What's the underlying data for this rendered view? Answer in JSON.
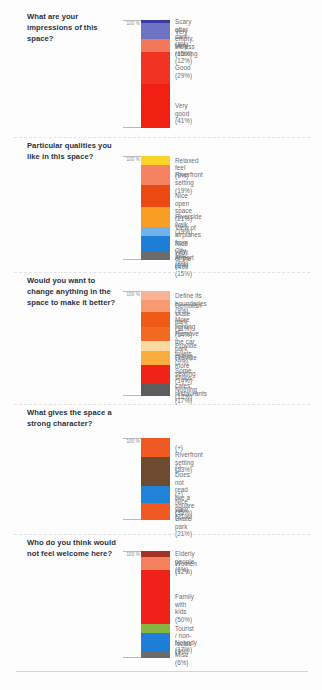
{
  "page": {
    "top_cut_text": "",
    "axis_label": "100 %"
  },
  "chart_data": [
    {
      "type": "bar",
      "stacked": true,
      "title": "What are your impressions of this space?",
      "xlabel": "",
      "ylabel": "100 %",
      "ylim": [
        0,
        100
      ],
      "grid": false,
      "legend_position": "right",
      "categories": [
        "Scary after dark",
        "Very empty, lifeless",
        "Very relaxing",
        "Good",
        "Very good"
      ],
      "values": [
        3,
        15,
        12,
        29,
        41
      ],
      "labels": [
        "Scary after dark (3%)",
        "Very empty, lifeless (15%)",
        "Very relaxing  (12%)",
        "Good (29%)",
        "Very good (41%)"
      ],
      "colors": [
        "#3a3aa8",
        "#6f73c4",
        "#f4775c",
        "#f03323",
        "#f02012"
      ]
    },
    {
      "type": "bar",
      "stacked": true,
      "title": "Particular qualities you like in this space?",
      "xlabel": "",
      "ylabel": "100 %",
      "ylim": [
        0,
        100
      ],
      "grid": false,
      "legend_position": "right",
      "categories": [
        "Relaxed feel",
        "Riverfront setting",
        "Nice open space",
        "Riverside walk",
        "View of airplanes from City Airport",
        "Nice view of the river",
        "Misc"
      ],
      "values": [
        9,
        19,
        21,
        19,
        9,
        15,
        8
      ],
      "labels": [
        "Relaxed feel (9%)",
        "Riverfront setting (19%)",
        "Nice open space (21%)",
        "Riverside walk (19%)",
        "View of airplanes from\nCity Airport (9%)",
        "Nice view of the river (15%)",
        "Misc (8%)"
      ],
      "colors": [
        "#fdd429",
        "#f58260",
        "#eb4b12",
        "#f99d23",
        "#71b2ec",
        "#1f7fd6",
        "#6b6b6b"
      ]
    },
    {
      "type": "bar",
      "stacked": true,
      "title": "Would you want to change anything in the space to make it better?",
      "xlabel": "",
      "ylabel": "100 %",
      "ylim": [
        0,
        100
      ],
      "grid": false,
      "legend_position": "right",
      "categories": [
        "Define its boundaries",
        "Demolish skate park",
        "More lighting",
        "Remove the car park",
        "Provide toilets",
        "Provide more seating",
        "Some shops, cafes, restaurants",
        "Nothing"
      ],
      "values": [
        9,
        11,
        14,
        14,
        9,
        14,
        17,
        12
      ],
      "labels": [
        "Define its boundaries (9%)",
        "Demolish skate park (11%)",
        "More lighting (14%)",
        "Remove the car park (14%)",
        "Provide toilets (9%)",
        "Provide more seating (14%)",
        "Some shops, cafes,\nrestaurants (17%)",
        "Nothing (12%)"
      ],
      "colors": [
        "#f8b394",
        "#f79a72",
        "#ef5a14",
        "#f26a21",
        "#fbd9a3",
        "#f9ad3c",
        "#ef2318",
        "#5d5d5d"
      ]
    },
    {
      "type": "bar",
      "stacked": true,
      "title": "What gives the space a strong character?",
      "xlabel": "",
      "ylabel": "100 %",
      "ylim": [
        0,
        100
      ],
      "grid": false,
      "legend_position": "right",
      "categories": [
        "(+) Riverfront setting",
        "(-) Does not read like a square",
        "(+) Nice view",
        "(+) Skate park"
      ],
      "values": [
        23,
        35,
        21,
        21
      ],
      "labels": [
        "(+) Riverfront setting (23%)",
        "(-) Does not read like a\n      square (35%)",
        "(+) Nice view (21%)",
        "(+) Skate park (21%)"
      ],
      "colors": [
        "#f05a22",
        "#6d4b30",
        "#2083d8",
        "#f05a22"
      ]
    },
    {
      "type": "bar",
      "stacked": true,
      "title": "Who do you think would not feel welcome here?",
      "xlabel": "",
      "ylabel": "100 %",
      "ylim": [
        0,
        100
      ],
      "grid": false,
      "legend_position": "right",
      "categories": [
        "Elderly people",
        "Women",
        "Family with kids",
        "Tourist / non-locals",
        "Nobody",
        "Misc"
      ],
      "values": [
        6,
        12,
        50,
        9,
        17,
        6
      ],
      "labels": [
        "Elderly people (6%)",
        "Women (12%)",
        "Family with kids (50%)",
        "Tourist / non-locals (9%)",
        "Nobody (17%)",
        "Misc (6%)"
      ],
      "colors": [
        "#a63226",
        "#f5815e",
        "#ef2118",
        "#86b541",
        "#1f7fd6",
        "#6b6b6b"
      ]
    }
  ]
}
